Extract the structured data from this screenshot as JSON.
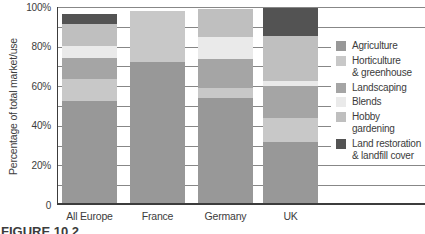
{
  "figure_label": "FIGURE 10.2",
  "y_axis": {
    "ticks": [
      {
        "label": "0",
        "value": 0
      },
      {
        "label": "20%",
        "value": 20
      },
      {
        "label": "40%",
        "value": 40
      },
      {
        "label": "60%",
        "value": 60
      },
      {
        "label": "80%",
        "value": 80
      },
      {
        "label": "100%",
        "value": 100
      }
    ]
  },
  "chart_data": {
    "type": "bar",
    "stacked": true,
    "title": "",
    "xlabel": "",
    "ylabel": "Percentage of total market/use",
    "ylim": [
      0,
      100
    ],
    "grid": "horizontal lines every 10%",
    "legend_position": "right",
    "categories": [
      "All Europe",
      "France",
      "Germany",
      "UK"
    ],
    "series": [
      {
        "name": "Agriculture",
        "legend_lines": [
          "Agriculture"
        ],
        "color": "#989898",
        "values": [
          52.5,
          72,
          54,
          32
        ]
      },
      {
        "name": "Horticulture & greenhouse",
        "legend_lines": [
          "Horticulture",
          "& greenhouse"
        ],
        "color": "#c8c8c8",
        "values": [
          11,
          26,
          5,
          12
        ]
      },
      {
        "name": "Landscaping",
        "legend_lines": [
          "Landscaping"
        ],
        "color": "#a5a5a5",
        "values": [
          11,
          0,
          15,
          16
        ]
      },
      {
        "name": "Blends",
        "legend_lines": [
          "Blends"
        ],
        "color": "#eaeaea",
        "values": [
          6,
          0,
          11,
          2.5
        ]
      },
      {
        "name": "Hobby gardening",
        "legend_lines": [
          "Hobby gardening"
        ],
        "color": "#bfbfbf",
        "values": [
          11,
          0,
          14,
          23
        ]
      },
      {
        "name": "Land restoration & landfill cover",
        "legend_lines": [
          "Land restoration",
          "& landfill cover"
        ],
        "color": "#535353",
        "values": [
          5,
          0,
          0,
          14
        ]
      }
    ]
  }
}
